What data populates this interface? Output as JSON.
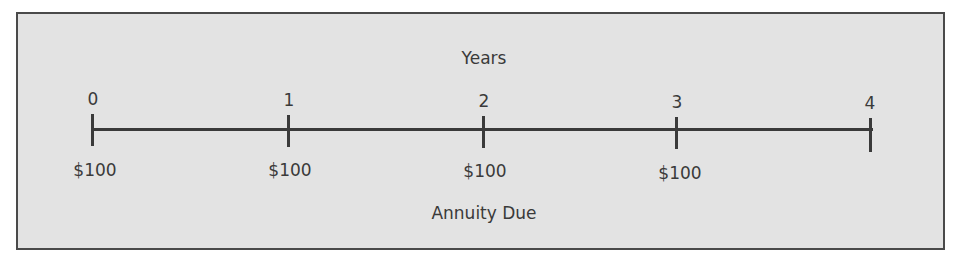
{
  "diagram": {
    "title": "Years",
    "caption": "Annuity Due",
    "colors": {
      "background": "#e3e3e3",
      "line": "#3a3a3a",
      "border": "#4a4a4a"
    },
    "periods": [
      {
        "label": "0",
        "cash_flow": "$100"
      },
      {
        "label": "1",
        "cash_flow": "$100"
      },
      {
        "label": "2",
        "cash_flow": "$100"
      },
      {
        "label": "3",
        "cash_flow": "$100"
      },
      {
        "label": "4",
        "cash_flow": ""
      }
    ]
  }
}
